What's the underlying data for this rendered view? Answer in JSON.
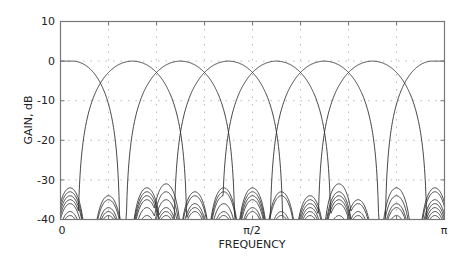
{
  "chart_data": {
    "type": "line",
    "title": "",
    "xlabel": "FREQUENCY",
    "ylabel": "GAIN, dB",
    "xlim": [
      0,
      3.14159
    ],
    "ylim": [
      -40,
      10
    ],
    "grid": true,
    "legend": null,
    "x_tick_labels": [
      "0",
      "π/2",
      "π"
    ],
    "x_tick_positions": [
      0,
      1.5708,
      3.14159
    ],
    "x_minor_ticks_count": 8,
    "y_ticks": [
      10,
      0,
      -10,
      -20,
      -30,
      -40
    ],
    "y_tick_labels": [
      "10",
      "0",
      "-10",
      "-20",
      "-30",
      "-40"
    ],
    "series": [
      {
        "name": "Channel 0 (lowpass)",
        "kind": "lowpass",
        "center": 0.0,
        "peak_db": 0,
        "crossover_db": -3,
        "sidelobe_peak_db": -31
      },
      {
        "name": "Channel 1",
        "kind": "bandpass",
        "center": 0.589,
        "peak_db": 0,
        "crossover_db": -3,
        "sidelobe_peak_db": -32
      },
      {
        "name": "Channel 2",
        "kind": "bandpass",
        "center": 0.9817,
        "peak_db": 0,
        "crossover_db": -3,
        "sidelobe_peak_db": -33
      },
      {
        "name": "Channel 3",
        "kind": "bandpass",
        "center": 1.3744,
        "peak_db": 0,
        "crossover_db": -3,
        "sidelobe_peak_db": -33
      },
      {
        "name": "Channel 4",
        "kind": "bandpass",
        "center": 1.7671,
        "peak_db": 0,
        "crossover_db": -3,
        "sidelobe_peak_db": -33
      },
      {
        "name": "Channel 5",
        "kind": "bandpass",
        "center": 2.1598,
        "peak_db": 0,
        "crossover_db": -3,
        "sidelobe_peak_db": -32
      },
      {
        "name": "Channel 6",
        "kind": "bandpass",
        "center": 2.5525,
        "peak_db": 0,
        "crossover_db": -3,
        "sidelobe_peak_db": -32
      },
      {
        "name": "Channel 7 (highpass)",
        "kind": "highpass",
        "center": 3.14159,
        "peak_db": 0,
        "crossover_db": -3,
        "sidelobe_peak_db": -31
      }
    ],
    "crossover_frequencies": [
      0.3927,
      0.7854,
      1.1781,
      1.5708,
      1.9635,
      2.3562,
      2.7489
    ],
    "sidelobe_lobe_centers": [
      0.0785,
      0.3927,
      0.7069,
      0.8639,
      1.0996,
      1.3352,
      1.5708,
      1.8064,
      2.042,
      2.2776,
      2.4347,
      2.7489,
      3.0631
    ]
  },
  "axes": {
    "xlabel": "FREQUENCY",
    "ylabel": "GAIN, dB",
    "x_ticks": {
      "zero": "0",
      "half": "π/2",
      "full": "π"
    },
    "y_ticks": [
      "10",
      "0",
      "-10",
      "-20",
      "-30",
      "-40"
    ]
  },
  "colors": {
    "curve": "#333333",
    "frame": "#777777",
    "grid": "#bbbbbb",
    "text": "#222222"
  }
}
